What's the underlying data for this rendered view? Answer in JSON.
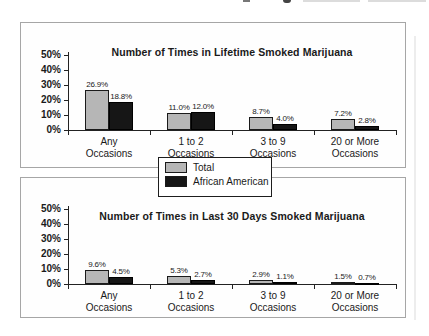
{
  "page": {
    "background": "#ffffff"
  },
  "legend": {
    "position": "centered between the two charts",
    "items": [
      {
        "label": "Total",
        "color": "#b6b6b6"
      },
      {
        "label": "African American",
        "color": "#161616"
      }
    ]
  },
  "chart_data": [
    {
      "type": "bar",
      "title": "Number of Times in Lifetime Smoked Marijuana",
      "categories": [
        [
          "Any",
          "Occasions"
        ],
        [
          "1 to 2",
          "Occasions"
        ],
        [
          "3 to 9",
          "Occasions"
        ],
        [
          "20 or More",
          "Occasions"
        ]
      ],
      "series": [
        {
          "name": "Total",
          "color": "#b6b6b6",
          "values": [
            26.9,
            11.0,
            8.7,
            7.2
          ],
          "labels": [
            "26.9%",
            "11.0%",
            "8.7%",
            "7.2%"
          ]
        },
        {
          "name": "African American",
          "color": "#161616",
          "values": [
            18.8,
            12.0,
            4.0,
            2.8
          ],
          "labels": [
            "18.8%",
            "12.0%",
            "4.0%",
            "2.8%"
          ]
        }
      ],
      "xlabel": "",
      "ylabel": "",
      "ylim": [
        0,
        50
      ],
      "yticks": [
        "50%",
        "40%",
        "30%",
        "20%",
        "10%",
        "0%"
      ],
      "grid": false
    },
    {
      "type": "bar",
      "title": "Number of Times in Last 30 Days Smoked Marijuana",
      "categories": [
        [
          "Any",
          "Occasions"
        ],
        [
          "1 to 2",
          "Occasions"
        ],
        [
          "3 to 9",
          "Occasions"
        ],
        [
          "20 or More",
          "Occasions"
        ]
      ],
      "series": [
        {
          "name": "Total",
          "color": "#b6b6b6",
          "values": [
            9.6,
            5.3,
            2.9,
            1.5
          ],
          "labels": [
            "9.6%",
            "5.3%",
            "2.9%",
            "1.5%"
          ]
        },
        {
          "name": "African American",
          "color": "#161616",
          "values": [
            4.5,
            2.7,
            1.1,
            0.7
          ],
          "labels": [
            "4.5%",
            "2.7%",
            "1.1%",
            "0.7%"
          ]
        }
      ],
      "xlabel": "",
      "ylabel": "",
      "ylim": [
        0,
        50
      ],
      "yticks": [
        "50%",
        "40%",
        "30%",
        "20%",
        "10%",
        "0%"
      ],
      "grid": false
    }
  ]
}
